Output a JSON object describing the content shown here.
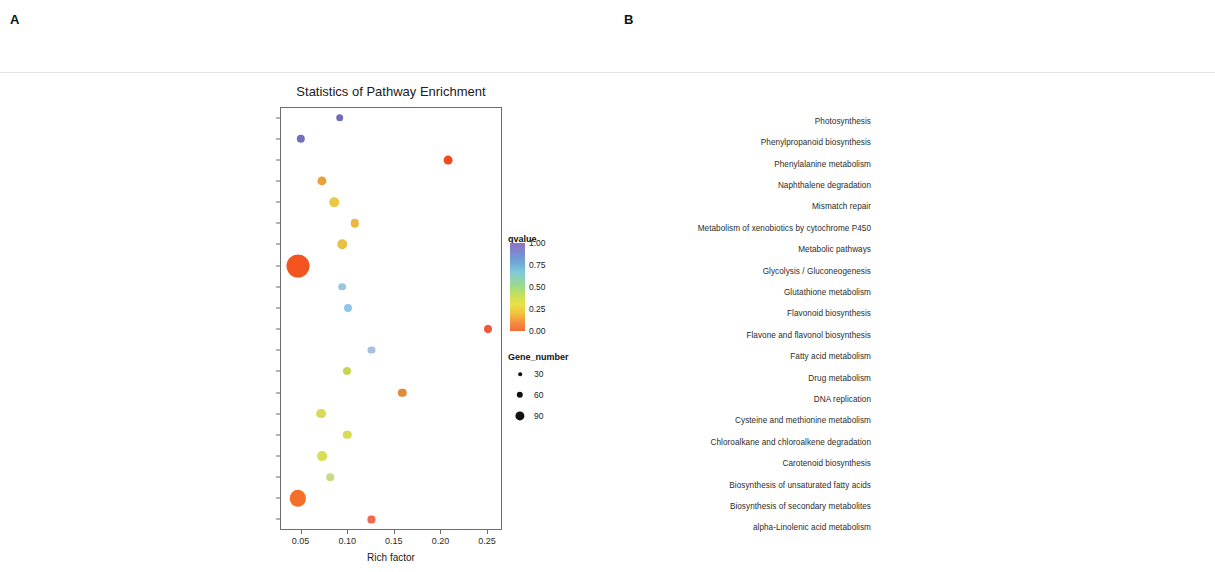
{
  "figure": {
    "panel_a_letter": "A",
    "panel_b_letter": "B"
  },
  "chart_data": [
    {
      "panel": "A",
      "type": "scatter",
      "title": "Statistics of Pathway Enrichment",
      "xlabel": "Rich factor",
      "ylabel": "",
      "xlim": [
        0.028,
        0.266
      ],
      "xticks": [
        0.05,
        0.1,
        0.15,
        0.2,
        0.25
      ],
      "xticklabels": [
        "0.05",
        "0.10",
        "0.15",
        "0.20",
        "0.25"
      ],
      "categories": [
        "Ubiquinone and other terpenoid-quinone biosynthesis",
        "Plant hormone signal transduction",
        "Photosynthesis",
        "Phenylpropanoid biosynthesis",
        "Phenylalanine metabolism",
        "Mismatch repair",
        "Metabolism of xenobiotics by cytochrome P450",
        "Metabolic pathways",
        "Glyoxylate and dicarboxylate metabolism",
        "Glutathione metabolism",
        "Flavonoid biosynthesis",
        "Flavone and flavonol biosynthesis",
        "Drug metabolism",
        "DNA replication",
        "Cysteine and methionine metabolism",
        "Carotenoid biosynthesis",
        "Carbon fixation in photosynthetic organisms",
        "Biosynthesis of unsaturated fatty acids",
        "Biosynthesis of secondary metabolites",
        "alpha-Linolenic acid metabolism"
      ],
      "points": [
        {
          "pathway": "Ubiquinone and other terpenoid-quinone biosynthesis",
          "rich_factor": 0.092,
          "qvalue": 0.92,
          "gene_number": 5,
          "color": "#6f6fb5"
        },
        {
          "pathway": "Plant hormone signal transduction",
          "rich_factor": 0.05,
          "qvalue": 0.93,
          "gene_number": 7,
          "color": "#7070bd"
        },
        {
          "pathway": "Photosynthesis",
          "rich_factor": 0.208,
          "qvalue": 0.04,
          "gene_number": 8,
          "color": "#f44a22"
        },
        {
          "pathway": "Phenylpropanoid biosynthesis",
          "rich_factor": 0.073,
          "qvalue": 0.18,
          "gene_number": 9,
          "color": "#e8a13a"
        },
        {
          "pathway": "Phenylalanine metabolism",
          "rich_factor": 0.086,
          "qvalue": 0.26,
          "gene_number": 10,
          "color": "#e9c94a"
        },
        {
          "pathway": "Mismatch repair",
          "rich_factor": 0.108,
          "qvalue": 0.23,
          "gene_number": 7,
          "color": "#edb63e"
        },
        {
          "pathway": "Metabolism of xenobiotics by cytochrome P450",
          "rich_factor": 0.095,
          "qvalue": 0.25,
          "gene_number": 10,
          "color": "#e8c048"
        },
        {
          "pathway": "Metabolic pathways",
          "rich_factor": 0.047,
          "qvalue": 0.02,
          "gene_number": 95,
          "color": "#f4541f"
        },
        {
          "pathway": "Glyoxylate and dicarboxylate metabolism",
          "rich_factor": 0.095,
          "qvalue": 0.55,
          "gene_number": 5,
          "color": "#9ac6e0"
        },
        {
          "pathway": "Glutathione metabolism",
          "rich_factor": 0.101,
          "qvalue": 0.62,
          "gene_number": 6,
          "color": "#8fc6e8"
        },
        {
          "pathway": "Flavonoid biosynthesis",
          "rich_factor": 0.251,
          "qvalue": 0.07,
          "gene_number": 6,
          "color": "#f0563a"
        },
        {
          "pathway": "Flavone and flavonol biosynthesis",
          "rich_factor": 0.126,
          "qvalue": 0.6,
          "gene_number": 4,
          "color": "#a7bfe0"
        },
        {
          "pathway": "Drug metabolism",
          "rich_factor": 0.1,
          "qvalue": 0.3,
          "gene_number": 6,
          "color": "#c7d450"
        },
        {
          "pathway": "DNA replication",
          "rich_factor": 0.159,
          "qvalue": 0.13,
          "gene_number": 7,
          "color": "#e08a3c"
        },
        {
          "pathway": "Cysteine and methionine metabolism",
          "rich_factor": 0.072,
          "qvalue": 0.32,
          "gene_number": 11,
          "color": "#d6dc58"
        },
        {
          "pathway": "Carotenoid biosynthesis",
          "rich_factor": 0.1,
          "qvalue": 0.33,
          "gene_number": 7,
          "color": "#d8dc52"
        },
        {
          "pathway": "Carbon fixation in photosynthetic organisms",
          "rich_factor": 0.073,
          "qvalue": 0.34,
          "gene_number": 11,
          "color": "#d8de56"
        },
        {
          "pathway": "Biosynthesis of unsaturated fatty acids",
          "rich_factor": 0.082,
          "qvalue": 0.46,
          "gene_number": 5,
          "color": "#c8dc86"
        },
        {
          "pathway": "Biosynthesis of secondary metabolites",
          "rich_factor": 0.047,
          "qvalue": 0.03,
          "gene_number": 42,
          "color": "#f4702a"
        },
        {
          "pathway": "alpha-Linolenic acid metabolism",
          "rich_factor": 0.126,
          "qvalue": 0.09,
          "gene_number": 4,
          "color": "#f06a50"
        }
      ],
      "legend": {
        "color_title": "qvalue",
        "color_ticks": [
          "1.00",
          "0.75",
          "0.50",
          "0.25",
          "0.00"
        ],
        "size_title": "Gene_number",
        "size_values": [
          "30",
          "60",
          "90"
        ]
      }
    },
    {
      "panel": "B",
      "type": "scatter",
      "title": "Statistics of Pathway Enrichment",
      "xlabel": "Rich factor",
      "ylabel": "",
      "xlim": [
        0.025,
        0.222
      ],
      "xticks": [
        0.05,
        0.1,
        0.15,
        0.2
      ],
      "xticklabels": [
        "0.05",
        "0.10",
        "0.15",
        "0.20"
      ],
      "categories": [
        "Photosynthesis",
        "Phenylpropanoid biosynthesis",
        "Phenylalanine metabolism",
        "Naphthalene degradation",
        "Mismatch repair",
        "Metabolism of xenobiotics by cytochrome P450",
        "Metabolic pathways",
        "Glycolysis / Gluconeogenesis",
        "Glutathione metabolism",
        "Flavonoid biosynthesis",
        "Flavone and flavonol biosynthesis",
        "Fatty acid metabolism",
        "Drug metabolism",
        "DNA replication",
        "Cysteine and methionine metabolism",
        "Chloroalkane and chloroalkene degradation",
        "Carotenoid biosynthesis",
        "Biosynthesis of unsaturated fatty acids",
        "Biosynthesis of secondary metabolites",
        "alpha-Linolenic acid metabolism"
      ],
      "points": [
        {
          "pathway": "Photosynthesis",
          "rich_factor": 0.194,
          "qvalue": 0.04,
          "gene_number": 9,
          "color": "#f2562a"
        },
        {
          "pathway": "Phenylpropanoid biosynthesis",
          "rich_factor": 0.053,
          "qvalue": 0.63,
          "gene_number": 6,
          "color": "#93b6d8"
        },
        {
          "pathway": "Phenylalanine metabolism",
          "rich_factor": 0.078,
          "qvalue": 0.29,
          "gene_number": 8,
          "color": "#dcd84e"
        },
        {
          "pathway": "Naphthalene degradation",
          "rich_factor": 0.142,
          "qvalue": 0.64,
          "gene_number": 4,
          "color": "#9cb8dd"
        },
        {
          "pathway": "Mismatch repair",
          "rich_factor": 0.11,
          "qvalue": 0.66,
          "gene_number": 4,
          "color": "#a2bcdd"
        },
        {
          "pathway": "Metabolism of xenobiotics by cytochrome P450",
          "rich_factor": 0.136,
          "qvalue": 0.1,
          "gene_number": 7,
          "color": "#ef6a34"
        },
        {
          "pathway": "Metabolic pathways",
          "rich_factor": 0.039,
          "qvalue": 0.01,
          "gene_number": 80,
          "color": "#f4541f"
        },
        {
          "pathway": "Glycolysis / Gluconeogenesis",
          "rich_factor": 0.052,
          "qvalue": 0.67,
          "gene_number": 5,
          "color": "#9dbada"
        },
        {
          "pathway": "Glutathione metabolism",
          "rich_factor": 0.063,
          "qvalue": 0.7,
          "gene_number": 5,
          "color": "#9bc0e2"
        },
        {
          "pathway": "Flavonoid biosynthesis",
          "rich_factor": 0.203,
          "qvalue": 0.06,
          "gene_number": 5,
          "color": "#f05e2e"
        },
        {
          "pathway": "Flavone and flavonol biosynthesis",
          "rich_factor": 0.11,
          "qvalue": 0.72,
          "gene_number": 3,
          "color": "#a6c3e2"
        },
        {
          "pathway": "Fatty acid metabolism",
          "rich_factor": 0.065,
          "qvalue": 0.68,
          "gene_number": 5,
          "color": "#9ebcdd"
        },
        {
          "pathway": "Drug metabolism",
          "rich_factor": 0.14,
          "qvalue": 0.11,
          "gene_number": 6,
          "color": "#ef6b44"
        },
        {
          "pathway": "DNA replication",
          "rich_factor": 0.158,
          "qvalue": 0.09,
          "gene_number": 7,
          "color": "#ef6a30"
        },
        {
          "pathway": "Cysteine and methionine metabolism",
          "rich_factor": 0.056,
          "qvalue": 0.74,
          "gene_number": 6,
          "color": "#a3c2e4"
        },
        {
          "pathway": "Chloroalkane and chloroalkene degradation",
          "rich_factor": 0.104,
          "qvalue": 0.76,
          "gene_number": 4,
          "color": "#abc7e6"
        },
        {
          "pathway": "Carotenoid biosynthesis",
          "rich_factor": 0.081,
          "qvalue": 0.7,
          "gene_number": 5,
          "color": "#a4c2e2"
        },
        {
          "pathway": "Biosynthesis of unsaturated fatty acids",
          "rich_factor": 0.085,
          "qvalue": 0.73,
          "gene_number": 4,
          "color": "#a8c5e4"
        },
        {
          "pathway": "Biosynthesis of secondary metabolites",
          "rich_factor": 0.04,
          "qvalue": 0.33,
          "gene_number": 34,
          "color": "#b3d63f"
        },
        {
          "pathway": "alpha-Linolenic acid metabolism",
          "rich_factor": 0.083,
          "qvalue": 0.27,
          "gene_number": 5,
          "color": "#e0d44e"
        }
      ],
      "legend": {
        "color_title": "qvalue",
        "color_ticks": [
          "1.00",
          "0.75",
          "0.50",
          "0.25",
          "0.00"
        ],
        "size_title": "Gene_number",
        "size_values": [
          "25",
          "50",
          "75"
        ]
      }
    }
  ]
}
